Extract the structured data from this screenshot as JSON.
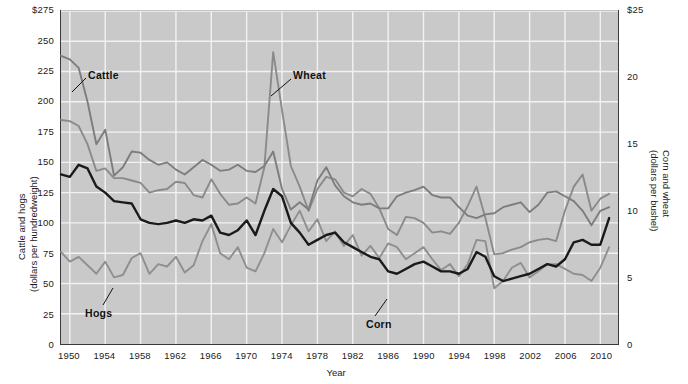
{
  "chart_data": {
    "type": "line",
    "title": "",
    "xlabel": "Year",
    "ylabel": "Cattle and hogs (dollars per hundredweight)",
    "y2label": "Corn and wheat (dollars per bushel)",
    "xlim": [
      1949,
      2012
    ],
    "ylim": [
      0,
      275
    ],
    "y2lim": [
      0,
      25
    ],
    "grid": true,
    "legend_position": "inline-annotations",
    "xticks": [
      1950,
      1954,
      1958,
      1962,
      1966,
      1970,
      1974,
      1978,
      1982,
      1986,
      1990,
      1994,
      1998,
      2002,
      2006,
      2010
    ],
    "xtick_labels": [
      "1950",
      "1954",
      "1958",
      "1962",
      "1966",
      "1970",
      "1974",
      "1978",
      "1982",
      "1986",
      "1990",
      "1994",
      "1998",
      "2002",
      "2006",
      "2010"
    ],
    "yticks": [
      0,
      25,
      50,
      75,
      100,
      125,
      150,
      175,
      200,
      225,
      250,
      275
    ],
    "ytick_labels": [
      "0",
      "25",
      "50",
      "75",
      "100",
      "125",
      "150",
      "175",
      "200",
      "225",
      "250",
      "$275"
    ],
    "y2ticks": [
      0,
      5,
      10,
      15,
      20,
      25
    ],
    "y2tick_labels": [
      "0",
      "5",
      "10",
      "15",
      "20",
      "$25"
    ],
    "x": [
      1949,
      1950,
      1951,
      1952,
      1953,
      1954,
      1955,
      1956,
      1957,
      1958,
      1959,
      1960,
      1961,
      1962,
      1963,
      1964,
      1965,
      1966,
      1967,
      1968,
      1969,
      1970,
      1971,
      1972,
      1973,
      1974,
      1975,
      1976,
      1977,
      1978,
      1979,
      1980,
      1981,
      1982,
      1983,
      1984,
      1985,
      1986,
      1987,
      1988,
      1989,
      1990,
      1991,
      1992,
      1993,
      1994,
      1995,
      1996,
      1997,
      1998,
      1999,
      2000,
      2001,
      2002,
      2003,
      2004,
      2005,
      2006,
      2007,
      2008,
      2009,
      2010,
      2011
    ],
    "series": [
      {
        "name": "Cattle",
        "axis": "left",
        "units": "dollars per hundredweight",
        "color": "#7d7d7d",
        "values": [
          238,
          235,
          228,
          200,
          165,
          177,
          139,
          146,
          159,
          158,
          152,
          148,
          150,
          144,
          140,
          146,
          152,
          148,
          143,
          144,
          148,
          143,
          142,
          147,
          159,
          128,
          111,
          117,
          111,
          135,
          146,
          131,
          122,
          117,
          115,
          116,
          112,
          112,
          122,
          125,
          127,
          130,
          123,
          121,
          121,
          113,
          106,
          104,
          107,
          108,
          113,
          115,
          117,
          109,
          115,
          125,
          126,
          122,
          118,
          110,
          98,
          110,
          113
        ]
      },
      {
        "name": "Hogs",
        "axis": "left",
        "units": "dollars per hundredweight",
        "color": "#8f8f8f",
        "values": [
          76,
          68,
          72,
          65,
          58,
          68,
          55,
          57,
          71,
          75,
          58,
          66,
          64,
          72,
          59,
          65,
          85,
          99,
          75,
          70,
          80,
          63,
          60,
          75,
          95,
          84,
          98,
          110,
          93,
          103,
          85,
          93,
          81,
          90,
          73,
          81,
          71,
          83,
          80,
          70,
          75,
          80,
          70,
          61,
          66,
          56,
          66,
          86,
          85,
          46,
          52,
          63,
          67,
          55,
          60,
          66,
          66,
          62,
          58,
          57,
          52,
          63,
          80
        ]
      },
      {
        "name": "Wheat",
        "axis": "right",
        "units": "dollars per bushel",
        "color": "#8a8a8a",
        "values": [
          185,
          184,
          180,
          165,
          143,
          145,
          137,
          137,
          135,
          133,
          125,
          127,
          128,
          134,
          133,
          123,
          121,
          136,
          124,
          115,
          116,
          121,
          116,
          146,
          241,
          193,
          147,
          130,
          110,
          128,
          138,
          136,
          125,
          122,
          128,
          124,
          112,
          95,
          90,
          105,
          104,
          100,
          92,
          93,
          91,
          100,
          114,
          130,
          104,
          74,
          75,
          78,
          80,
          84,
          86,
          87,
          85,
          110,
          130,
          140,
          110,
          120,
          124
        ]
      },
      {
        "name": "Corn",
        "axis": "right",
        "units": "dollars per bushel",
        "color": "#1a1a1a",
        "values": [
          140,
          138,
          148,
          145,
          130,
          125,
          118,
          117,
          116,
          103,
          100,
          99,
          100,
          102,
          100,
          103,
          102,
          106,
          92,
          90,
          94,
          102,
          90,
          110,
          128,
          122,
          100,
          92,
          82,
          86,
          90,
          92,
          84,
          80,
          76,
          72,
          70,
          60,
          58,
          62,
          66,
          68,
          64,
          60,
          60,
          58,
          62,
          76,
          72,
          56,
          52,
          54,
          56,
          58,
          62,
          66,
          64,
          70,
          84,
          86,
          82,
          82,
          104
        ]
      }
    ],
    "annotations": [
      {
        "label": "Cattle",
        "x_px": 88,
        "y_px": 69
      },
      {
        "label": "Wheat",
        "x_px": 293,
        "y_px": 69
      },
      {
        "label": "Hogs",
        "x_px": 85,
        "y_px": 307
      },
      {
        "label": "Corn",
        "x_px": 366,
        "y_px": 318
      }
    ]
  },
  "axes": {
    "left_title_line1": "Cattle and hogs",
    "left_title_line2": "(dollars per hundredweight)",
    "right_title_line1": "Corn and wheat",
    "right_title_line2": "(dollars per bushel)",
    "x_title": "Year"
  },
  "colors": {
    "plot_background": "#c9c9c9",
    "grid": "#f0f0f0",
    "frame": "#3a3a3a",
    "cattle": "#7d7d7d",
    "hogs": "#8f8f8f",
    "wheat": "#8a8a8a",
    "corn": "#1a1a1a",
    "text": "#1a1a1a"
  }
}
